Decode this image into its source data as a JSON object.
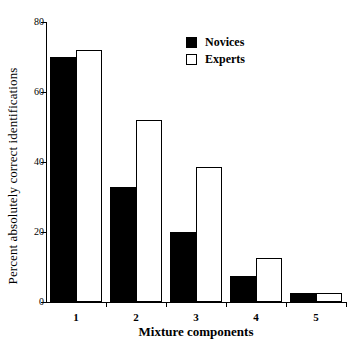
{
  "chart_data": {
    "type": "bar",
    "title": "",
    "xlabel": "Mixture components",
    "ylabel": "Percent absolutely correct identifications",
    "categories": [
      "1",
      "2",
      "3",
      "4",
      "5"
    ],
    "series": [
      {
        "name": "Novices",
        "color": "#000000",
        "fill": "solid",
        "values": [
          70,
          33,
          20,
          7.5,
          2.5
        ]
      },
      {
        "name": "Experts",
        "color": "#ffffff",
        "fill": "open",
        "values": [
          72,
          52,
          38.5,
          12.5,
          2.5
        ]
      }
    ],
    "ylim": [
      0,
      80
    ],
    "yticks": [
      0,
      20,
      40,
      60,
      80
    ],
    "ytick_labels": [
      "0",
      "20",
      "40",
      "60",
      "80"
    ],
    "grid": false,
    "legend_position": "top-right"
  },
  "legend": {
    "entries": [
      {
        "label": "Novices",
        "swatch": "filled-square"
      },
      {
        "label": "Experts",
        "swatch": "open-square"
      }
    ]
  }
}
